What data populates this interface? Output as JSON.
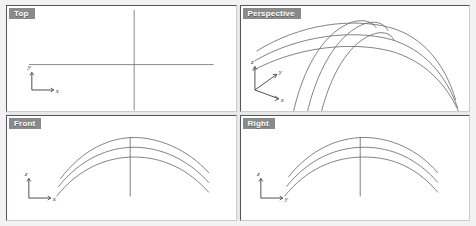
{
  "app": {
    "name": "cad-viewport-window",
    "background_color": "#f2f2f2",
    "viewport_background": "#ffffff",
    "curve_color": "#6b6b6b",
    "title_tab_color": "#8a8a8a",
    "title_text_color": "#ffffff"
  },
  "viewports": [
    {
      "id": "top",
      "label": "Top",
      "position": "top-left",
      "gizmo": {
        "axes": [
          {
            "name": "y",
            "label": "y",
            "direction": "up"
          },
          {
            "name": "x",
            "label": "x",
            "direction": "right"
          }
        ]
      },
      "geometry": {
        "description": "two straight construction lines crossing",
        "lines": [
          {
            "name": "vertical-line",
            "x1": 128,
            "y1": 4,
            "x2": 128,
            "y2": 107
          },
          {
            "name": "horizontal-line",
            "x1": 22,
            "y1": 60,
            "x2": 208,
            "y2": 60
          }
        ],
        "arcs": []
      }
    },
    {
      "id": "perspective",
      "label": "Perspective",
      "position": "top-right",
      "gizmo": {
        "axes": [
          {
            "name": "z",
            "label": "z",
            "direction": "up"
          },
          {
            "name": "y",
            "label": "y",
            "direction": "up-right"
          },
          {
            "name": "x",
            "label": "x",
            "direction": "down-right"
          }
        ]
      },
      "geometry": {
        "description": "three long shallow arcs crossed by three steep arcs",
        "lines": [],
        "arcs": [
          {
            "name": "long-arc-1",
            "d": "M 16 46 C 60 18, 112 12, 150 22 C 182 31, 205 58, 216 96"
          },
          {
            "name": "long-arc-2",
            "d": "M 14 56 C 58 30, 112 24, 150 34 C 184 44, 206 70, 218 104"
          },
          {
            "name": "long-arc-3",
            "d": "M 12 66 C 56 42, 110 36, 150 46 C 185 56, 207 80, 220 110"
          },
          {
            "name": "steep-arc-1",
            "d": "M 52 112 C 62 64, 82 30, 108 18 C 120 13, 130 14, 136 22"
          },
          {
            "name": "steep-arc-2",
            "d": "M 66 112 C 76 66, 96 32, 120 20 C 133 14, 143 16, 148 25"
          },
          {
            "name": "steep-arc-3",
            "d": "M 80 112 C 90 70, 108 40, 130 30 C 142 25, 150 27, 154 35"
          }
        ]
      }
    },
    {
      "id": "front",
      "label": "Front",
      "position": "bottom-left",
      "gizmo": {
        "axes": [
          {
            "name": "z",
            "label": "z",
            "direction": "up"
          },
          {
            "name": "x",
            "label": "x",
            "direction": "right"
          }
        ]
      },
      "geometry": {
        "description": "three nested shallow arcs with a vertical line through the apex",
        "lines": [
          {
            "name": "vertical-line",
            "x1": 124,
            "y1": 22,
            "x2": 124,
            "y2": 82
          }
        ],
        "arcs": [
          {
            "name": "arc-outer",
            "d": "M 54 64 C 76 34, 104 22, 128 22 C 152 22, 182 34, 203 58"
          },
          {
            "name": "arc-middle",
            "d": "M 52 72 C 74 44, 102 32, 128 32 C 154 32, 182 44, 203 68"
          },
          {
            "name": "arc-inner",
            "d": "M 50 82 C 72 54, 100 42, 128 42 C 156 42, 182 54, 203 78"
          }
        ]
      }
    },
    {
      "id": "right",
      "label": "Right",
      "position": "bottom-right",
      "gizmo": {
        "axes": [
          {
            "name": "z",
            "label": "z",
            "direction": "up"
          },
          {
            "name": "y",
            "label": "y",
            "direction": "right"
          }
        ]
      },
      "geometry": {
        "description": "three nested shallow arcs with a vertical line through the apex",
        "lines": [
          {
            "name": "vertical-line",
            "x1": 120,
            "y1": 22,
            "x2": 120,
            "y2": 82
          }
        ],
        "arcs": [
          {
            "name": "arc-outer",
            "d": "M 48 62 C 70 34, 98 22, 124 22 C 150 22, 178 34, 198 58"
          },
          {
            "name": "arc-middle",
            "d": "M 46 72 C 68 44, 96 32, 124 32 C 152 32, 178 44, 198 68"
          },
          {
            "name": "arc-inner",
            "d": "M 44 82 C 66 54, 94 42, 124 42 C 154 42, 178 54, 198 78"
          }
        ]
      }
    }
  ]
}
